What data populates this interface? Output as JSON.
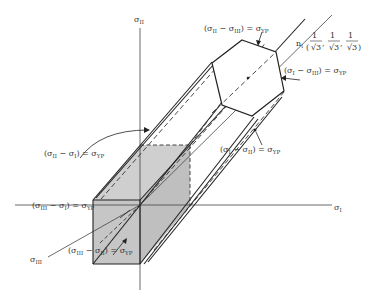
{
  "diagram": {
    "axes": {
      "sigma_I": "σ",
      "sigma_I_sub": "I",
      "sigma_II": "σ",
      "sigma_II_sub": "II",
      "sigma_III": "σ",
      "sigma_III_sub": "III"
    },
    "normal": {
      "label": "n",
      "label_sub": "i",
      "vector": "(1/√3, 1/√3, 1/√3)",
      "components": [
        "1",
        "√3"
      ]
    },
    "planes": [
      {
        "id": "II-III",
        "text": "(σ",
        "a": "II",
        "mid": " − σ",
        "b": "III",
        "eq": ") = σ",
        "yp": "YP"
      },
      {
        "id": "I-III",
        "text": "(σ",
        "a": "I",
        "mid": " − σ",
        "b": "III",
        "eq": ") = σ",
        "yp": "YP"
      },
      {
        "id": "I-II",
        "text": "(σ",
        "a": "I",
        "mid": " − σ",
        "b": "II",
        "eq": ") = σ",
        "yp": "YP"
      },
      {
        "id": "II-I",
        "text": "(σ",
        "a": "II",
        "mid": " − σ",
        "b": "I",
        "eq": ") = σ",
        "yp": "YP"
      },
      {
        "id": "III-I",
        "text": "(σ",
        "a": "III",
        "mid": " − σ",
        "b": "I",
        "eq": ") = σ",
        "yp": "YP"
      },
      {
        "id": "III-II",
        "text": "(σ",
        "a": "III",
        "mid": " − σ",
        "b": "II",
        "eq": ") = σ",
        "yp": "YP"
      }
    ],
    "colors": {
      "line": "#222222",
      "axis": "#444444",
      "fill": "#c8c8c8",
      "text": "#333333"
    }
  }
}
